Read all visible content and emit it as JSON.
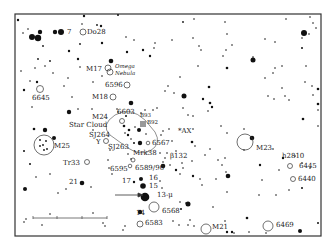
{
  "frame": {
    "x": 15,
    "y": 14,
    "w": 306,
    "h": 222
  },
  "colors": {
    "ink": "#111111",
    "background": "#ffffff",
    "frame": "#333333"
  },
  "scale_bar": {
    "x1": 33,
    "x2": 107,
    "y": 218,
    "ticks": [
      57,
      82
    ]
  },
  "arrow": {
    "x1": 115,
    "y1": 195,
    "x2": 143,
    "y2": 195,
    "label_target": "13-μ"
  },
  "labels": [
    {
      "id": "label-7",
      "text": "7",
      "x": 67,
      "y": 34
    },
    {
      "id": "label-do28",
      "text": "Do28",
      "x": 87,
      "y": 34
    },
    {
      "id": "label-m17",
      "text": "M17",
      "x": 86,
      "y": 71
    },
    {
      "id": "label-omega",
      "text": "Omega",
      "x": 115,
      "y": 68,
      "italic": true
    },
    {
      "id": "label-nebula",
      "text": "Nebula",
      "x": 115,
      "y": 75,
      "italic": true
    },
    {
      "id": "label-6596",
      "text": "6596",
      "x": 105,
      "y": 87
    },
    {
      "id": "label-6645",
      "text": "6645",
      "x": 32,
      "y": 100
    },
    {
      "id": "label-m18",
      "text": "M18",
      "x": 92,
      "y": 99
    },
    {
      "id": "label-6603",
      "text": "6603",
      "x": 117,
      "y": 114
    },
    {
      "id": "label-b93",
      "text": "B93",
      "x": 140,
      "y": 117,
      "small": true
    },
    {
      "id": "label-b92",
      "text": "B92",
      "x": 147,
      "y": 124,
      "small": true
    },
    {
      "id": "label-m24",
      "text": "M24",
      "x": 92,
      "y": 119
    },
    {
      "id": "label-star-cloud",
      "text": "Star Cloud",
      "x": 69,
      "y": 127
    },
    {
      "id": "label-sj264",
      "text": "SJ264",
      "x": 89,
      "y": 137
    },
    {
      "id": "label-y",
      "text": "Y",
      "x": 96,
      "y": 144
    },
    {
      "id": "label-sj263",
      "text": "SJ263",
      "x": 108,
      "y": 149
    },
    {
      "id": "label-ax",
      "text": "*AX",
      "x": 178,
      "y": 133
    },
    {
      "id": "label-6567",
      "text": "6567",
      "x": 152,
      "y": 145
    },
    {
      "id": "label-mrk38",
      "text": "Mrk38",
      "x": 133,
      "y": 155
    },
    {
      "id": "label-m25",
      "text": "M25",
      "x": 54,
      "y": 148
    },
    {
      "id": "label-b132",
      "text": "β132",
      "x": 170,
      "y": 158
    },
    {
      "id": "label-m23",
      "text": "M23",
      "x": 256,
      "y": 150
    },
    {
      "id": "label-tr33",
      "text": "Tr33",
      "x": 63,
      "y": 165
    },
    {
      "id": "label-6595",
      "text": "6595",
      "x": 110,
      "y": 171
    },
    {
      "id": "label-6589-90",
      "text": "6589/90",
      "x": 135,
      "y": 170
    },
    {
      "id": "label-h2810",
      "text": "h2810",
      "x": 282,
      "y": 158
    },
    {
      "id": "label-6445",
      "text": "6445",
      "x": 299,
      "y": 168
    },
    {
      "id": "label-6440",
      "text": "6440",
      "x": 298,
      "y": 181
    },
    {
      "id": "label-16",
      "text": "16",
      "x": 149,
      "y": 180
    },
    {
      "id": "label-17",
      "text": "17",
      "x": 122,
      "y": 183
    },
    {
      "id": "label-15",
      "text": "15",
      "x": 149,
      "y": 188
    },
    {
      "id": "label-13mu",
      "text": "13-μ",
      "x": 157,
      "y": 197
    },
    {
      "id": "label-21",
      "text": "21",
      "x": 69,
      "y": 184
    },
    {
      "id": "label-14",
      "text": "14",
      "x": 136,
      "y": 215
    },
    {
      "id": "label-6568",
      "text": "6568",
      "x": 162,
      "y": 213
    },
    {
      "id": "label-6583",
      "text": "6583",
      "x": 145,
      "y": 225
    },
    {
      "id": "label-m21",
      "text": "M21",
      "x": 212,
      "y": 229
    },
    {
      "id": "label-6469",
      "text": "6469",
      "x": 276,
      "y": 227
    }
  ],
  "open_objects": [
    {
      "id": "do28",
      "x": 83,
      "y": 32,
      "r": 3
    },
    {
      "id": "m17-a",
      "x": 108,
      "y": 68,
      "r": 3
    },
    {
      "id": "m17-b",
      "x": 110,
      "y": 72,
      "r": 3
    },
    {
      "id": "6596",
      "x": 127,
      "y": 85,
      "r": 3
    },
    {
      "id": "6645",
      "x": 40,
      "y": 89,
      "r": 3.5
    },
    {
      "id": "m18",
      "x": 113,
      "y": 97,
      "r": 3
    },
    {
      "id": "6603",
      "x": 122,
      "y": 121,
      "r": 2.5
    },
    {
      "id": "y-var",
      "x": 106,
      "y": 141,
      "r": 2.5
    },
    {
      "id": "m25",
      "x": 44,
      "y": 145,
      "r": 10
    },
    {
      "id": "m23",
      "x": 245,
      "y": 142,
      "r": 8
    },
    {
      "id": "tr33",
      "x": 87,
      "y": 162,
      "r": 2.5
    },
    {
      "id": "6595",
      "x": 133,
      "y": 160,
      "r": 2
    },
    {
      "id": "6589",
      "x": 130,
      "y": 166,
      "r": 1.8
    },
    {
      "id": "6445",
      "x": 290,
      "y": 166,
      "r": 2.5
    },
    {
      "id": "6440",
      "x": 293,
      "y": 179,
      "r": 2.5
    },
    {
      "id": "6568",
      "x": 154,
      "y": 207,
      "r": 5
    },
    {
      "id": "6583",
      "x": 140,
      "y": 224,
      "r": 3
    },
    {
      "id": "m21",
      "x": 206,
      "y": 229,
      "r": 5
    },
    {
      "id": "6469",
      "x": 268,
      "y": 226,
      "r": 5
    },
    {
      "id": "6567",
      "x": 148,
      "y": 143,
      "r": 1.8
    }
  ],
  "star_cloud_outline": "M 115 115 Q 130 106 145 120 L 155 132 Q 162 144 150 151 Q 140 156 128 148 L 110 135 Q 100 125 115 115 Z",
  "gray_patches": [
    {
      "id": "b92",
      "x": 140,
      "y": 121,
      "w": 6,
      "h": 6
    }
  ],
  "stars": [
    {
      "x": 18,
      "y": 20,
      "r": 1.2
    },
    {
      "x": 84,
      "y": 16,
      "r": 1.2
    },
    {
      "x": 118,
      "y": 15,
      "r": 1
    },
    {
      "x": 23,
      "y": 33,
      "r": 0.8
    },
    {
      "x": 28,
      "y": 29,
      "r": 0.8
    },
    {
      "x": 32,
      "y": 37,
      "r": 3
    },
    {
      "x": 38,
      "y": 38,
      "r": 3.2
    },
    {
      "x": 40,
      "y": 32,
      "r": 2.2
    },
    {
      "x": 55,
      "y": 32,
      "r": 2.2
    },
    {
      "x": 61,
      "y": 32,
      "r": 3
    },
    {
      "x": 43,
      "y": 46,
      "r": 0.9
    },
    {
      "x": 97,
      "y": 25,
      "r": 0.9
    },
    {
      "x": 101,
      "y": 26,
      "r": 1.2
    },
    {
      "x": 82,
      "y": 24,
      "r": 0.8
    },
    {
      "x": 69,
      "y": 51,
      "r": 1.2
    },
    {
      "x": 102,
      "y": 43,
      "r": 1.2
    },
    {
      "x": 80,
      "y": 44,
      "r": 0.9
    },
    {
      "x": 126,
      "y": 37,
      "r": 0.8
    },
    {
      "x": 134,
      "y": 40,
      "r": 0.8
    },
    {
      "x": 127,
      "y": 52,
      "r": 1.2
    },
    {
      "x": 143,
      "y": 50,
      "r": 1.2
    },
    {
      "x": 150,
      "y": 56,
      "r": 1.2
    },
    {
      "x": 154,
      "y": 48,
      "r": 0.8
    },
    {
      "x": 155,
      "y": 43,
      "r": 0.8
    },
    {
      "x": 38,
      "y": 59,
      "r": 0.9
    },
    {
      "x": 50,
      "y": 61,
      "r": 0.9
    },
    {
      "x": 35,
      "y": 68,
      "r": 0.8
    },
    {
      "x": 45,
      "y": 66,
      "r": 0.8
    },
    {
      "x": 53,
      "y": 73,
      "r": 0.8
    },
    {
      "x": 21,
      "y": 71,
      "r": 0.8
    },
    {
      "x": 78,
      "y": 59,
      "r": 1.2
    },
    {
      "x": 80,
      "y": 67,
      "r": 0.8
    },
    {
      "x": 111,
      "y": 61,
      "r": 2.3
    },
    {
      "x": 102,
      "y": 76,
      "r": 0.8
    },
    {
      "x": 30,
      "y": 81,
      "r": 0.8
    },
    {
      "x": 37,
      "y": 82,
      "r": 1.2
    },
    {
      "x": 68,
      "y": 78,
      "r": 0.8
    },
    {
      "x": 24,
      "y": 90,
      "r": 1.2
    },
    {
      "x": 64,
      "y": 86,
      "r": 0.8
    },
    {
      "x": 93,
      "y": 82,
      "r": 0.8
    },
    {
      "x": 72,
      "y": 97,
      "r": 0.8
    },
    {
      "x": 32,
      "y": 107,
      "r": 0.8
    },
    {
      "x": 131,
      "y": 103,
      "r": 2.3
    },
    {
      "x": 126,
      "y": 116,
      "r": 1
    },
    {
      "x": 117,
      "y": 109,
      "r": 0.8
    },
    {
      "x": 69,
      "y": 112,
      "r": 2.2
    },
    {
      "x": 78,
      "y": 109,
      "r": 0.8
    },
    {
      "x": 92,
      "y": 109,
      "r": 0.8
    },
    {
      "x": 183,
      "y": 22,
      "r": 0.9
    },
    {
      "x": 194,
      "y": 19,
      "r": 0.8
    },
    {
      "x": 225,
      "y": 22,
      "r": 0.8
    },
    {
      "x": 172,
      "y": 40,
      "r": 0.8
    },
    {
      "x": 193,
      "y": 38,
      "r": 0.8
    },
    {
      "x": 199,
      "y": 46,
      "r": 0.8
    },
    {
      "x": 201,
      "y": 50,
      "r": 0.8
    },
    {
      "x": 227,
      "y": 34,
      "r": 0.8
    },
    {
      "x": 226,
      "y": 50,
      "r": 0.8
    },
    {
      "x": 223,
      "y": 56,
      "r": 0.8
    },
    {
      "x": 232,
      "y": 45,
      "r": 0.8
    },
    {
      "x": 253,
      "y": 57,
      "r": 0.8
    },
    {
      "x": 253,
      "y": 60,
      "r": 2.5
    },
    {
      "x": 198,
      "y": 66,
      "r": 0.8
    },
    {
      "x": 227,
      "y": 68,
      "r": 1.3
    },
    {
      "x": 180,
      "y": 77,
      "r": 0.8
    },
    {
      "x": 165,
      "y": 91,
      "r": 0.8
    },
    {
      "x": 168,
      "y": 86,
      "r": 0.8
    },
    {
      "x": 209,
      "y": 87,
      "r": 1.3
    },
    {
      "x": 184,
      "y": 96,
      "r": 2.5
    },
    {
      "x": 203,
      "y": 99,
      "r": 1.2
    },
    {
      "x": 210,
      "y": 103,
      "r": 1.3
    },
    {
      "x": 212,
      "y": 107,
      "r": 1.2
    },
    {
      "x": 174,
      "y": 93,
      "r": 0.8
    },
    {
      "x": 193,
      "y": 116,
      "r": 0.8
    },
    {
      "x": 208,
      "y": 111,
      "r": 0.8
    },
    {
      "x": 265,
      "y": 39,
      "r": 0.8
    },
    {
      "x": 275,
      "y": 42,
      "r": 0.8
    },
    {
      "x": 286,
      "y": 19,
      "r": 0.8
    },
    {
      "x": 302,
      "y": 38,
      "r": 0.8
    },
    {
      "x": 302,
      "y": 48,
      "r": 1
    },
    {
      "x": 304,
      "y": 33,
      "r": 3
    },
    {
      "x": 309,
      "y": 34,
      "r": 0.8
    },
    {
      "x": 313,
      "y": 23,
      "r": 0.8
    },
    {
      "x": 316,
      "y": 28,
      "r": 0.8
    },
    {
      "x": 310,
      "y": 17,
      "r": 0.8
    },
    {
      "x": 275,
      "y": 68,
      "r": 0.8
    },
    {
      "x": 282,
      "y": 66,
      "r": 0.8
    },
    {
      "x": 265,
      "y": 78,
      "r": 0.8
    },
    {
      "x": 273,
      "y": 73,
      "r": 0.8
    },
    {
      "x": 282,
      "y": 88,
      "r": 0.8
    },
    {
      "x": 305,
      "y": 82,
      "r": 0.8
    },
    {
      "x": 306,
      "y": 66,
      "r": 0.8
    },
    {
      "x": 312,
      "y": 86,
      "r": 0.8
    },
    {
      "x": 318,
      "y": 89,
      "r": 1.3
    },
    {
      "x": 313,
      "y": 95,
      "r": 0.8
    },
    {
      "x": 318,
      "y": 104,
      "r": 1.3
    },
    {
      "x": 318,
      "y": 110,
      "r": 0.8
    },
    {
      "x": 268,
      "y": 96,
      "r": 0.8
    },
    {
      "x": 274,
      "y": 99,
      "r": 0.8
    },
    {
      "x": 285,
      "y": 96,
      "r": 0.8
    },
    {
      "x": 289,
      "y": 100,
      "r": 0.8
    },
    {
      "x": 303,
      "y": 119,
      "r": 1.3
    },
    {
      "x": 318,
      "y": 126,
      "r": 0.8
    },
    {
      "x": 169,
      "y": 129,
      "r": 0.8
    },
    {
      "x": 183,
      "y": 108,
      "r": 0.8
    },
    {
      "x": 188,
      "y": 115,
      "r": 0.8
    },
    {
      "x": 192,
      "y": 142,
      "r": 1.3
    },
    {
      "x": 205,
      "y": 155,
      "r": 0.8
    },
    {
      "x": 210,
      "y": 149,
      "r": 0.8
    },
    {
      "x": 221,
      "y": 126,
      "r": 0.8
    },
    {
      "x": 227,
      "y": 133,
      "r": 0.8
    },
    {
      "x": 244,
      "y": 129,
      "r": 0.8
    },
    {
      "x": 252,
      "y": 138,
      "r": 2.3
    },
    {
      "x": 273,
      "y": 149,
      "r": 0.8
    },
    {
      "x": 283,
      "y": 158,
      "r": 1.2
    },
    {
      "x": 244,
      "y": 150,
      "r": 0.8
    },
    {
      "x": 225,
      "y": 158,
      "r": 0.8
    },
    {
      "x": 260,
      "y": 165,
      "r": 1.2
    },
    {
      "x": 279,
      "y": 170,
      "r": 0.8
    },
    {
      "x": 295,
      "y": 156,
      "r": 0.8
    },
    {
      "x": 302,
      "y": 163,
      "r": 0.8
    },
    {
      "x": 310,
      "y": 168,
      "r": 0.8
    },
    {
      "x": 289,
      "y": 190,
      "r": 0.8
    },
    {
      "x": 302,
      "y": 188,
      "r": 1
    },
    {
      "x": 226,
      "y": 172,
      "r": 0.8
    },
    {
      "x": 216,
      "y": 179,
      "r": 0.8
    },
    {
      "x": 227,
      "y": 192,
      "r": 0.8
    },
    {
      "x": 262,
      "y": 180,
      "r": 0.8
    },
    {
      "x": 193,
      "y": 176,
      "r": 1.2
    },
    {
      "x": 202,
      "y": 185,
      "r": 0.8
    },
    {
      "x": 200,
      "y": 179,
      "r": 0.8
    },
    {
      "x": 218,
      "y": 160,
      "r": 0.8
    },
    {
      "x": 222,
      "y": 165,
      "r": 0.8
    },
    {
      "x": 228,
      "y": 176,
      "r": 2.3
    },
    {
      "x": 259,
      "y": 195,
      "r": 0.8
    },
    {
      "x": 276,
      "y": 195,
      "r": 0.8
    },
    {
      "x": 213,
      "y": 207,
      "r": 0.8
    },
    {
      "x": 247,
      "y": 218,
      "r": 1.3
    },
    {
      "x": 225,
      "y": 221,
      "r": 0.8
    },
    {
      "x": 227,
      "y": 232,
      "r": 1.2
    },
    {
      "x": 232,
      "y": 232,
      "r": 1.2
    },
    {
      "x": 234,
      "y": 233,
      "r": 0.8
    },
    {
      "x": 249,
      "y": 232,
      "r": 0.8
    },
    {
      "x": 266,
      "y": 233,
      "r": 0.8
    },
    {
      "x": 300,
      "y": 231,
      "r": 2
    },
    {
      "x": 318,
      "y": 223,
      "r": 1
    },
    {
      "x": 180,
      "y": 174,
      "r": 0.8
    },
    {
      "x": 180,
      "y": 202,
      "r": 0.8
    },
    {
      "x": 186,
      "y": 203,
      "r": 0.8
    },
    {
      "x": 188,
      "y": 204,
      "r": 2.5
    },
    {
      "x": 181,
      "y": 209,
      "r": 1
    },
    {
      "x": 190,
      "y": 220,
      "r": 0.8
    },
    {
      "x": 173,
      "y": 221,
      "r": 0.8
    },
    {
      "x": 179,
      "y": 225,
      "r": 0.8
    },
    {
      "x": 194,
      "y": 226,
      "r": 0.8
    },
    {
      "x": 188,
      "y": 225,
      "r": 0.8
    },
    {
      "x": 34,
      "y": 129,
      "r": 1.3
    },
    {
      "x": 45,
      "y": 130,
      "r": 2.2
    },
    {
      "x": 24,
      "y": 151,
      "r": 1
    },
    {
      "x": 54,
      "y": 138,
      "r": 2
    },
    {
      "x": 40,
      "y": 140,
      "r": 0.9
    },
    {
      "x": 46,
      "y": 141,
      "r": 0.9
    },
    {
      "x": 43,
      "y": 145,
      "r": 0.9
    },
    {
      "x": 40,
      "y": 146,
      "r": 0.9
    },
    {
      "x": 47,
      "y": 149,
      "r": 0.9
    },
    {
      "x": 44,
      "y": 150,
      "r": 0.9
    },
    {
      "x": 30,
      "y": 164,
      "r": 1
    },
    {
      "x": 36,
      "y": 177,
      "r": 0.8
    },
    {
      "x": 50,
      "y": 174,
      "r": 0.8
    },
    {
      "x": 25,
      "y": 189,
      "r": 2
    },
    {
      "x": 58,
      "y": 193,
      "r": 0.8
    },
    {
      "x": 66,
      "y": 189,
      "r": 0.8
    },
    {
      "x": 82,
      "y": 183,
      "r": 2.3
    },
    {
      "x": 91,
      "y": 187,
      "r": 0.8
    },
    {
      "x": 50,
      "y": 214,
      "r": 0.8
    },
    {
      "x": 93,
      "y": 213,
      "r": 0.8
    },
    {
      "x": 26,
      "y": 219,
      "r": 0.8
    },
    {
      "x": 24,
      "y": 222,
      "r": 0.8
    },
    {
      "x": 42,
      "y": 225,
      "r": 0.8
    },
    {
      "x": 103,
      "y": 223,
      "r": 0.8
    },
    {
      "x": 105,
      "y": 226,
      "r": 0.8
    },
    {
      "x": 125,
      "y": 226,
      "r": 0.8
    },
    {
      "x": 123,
      "y": 230,
      "r": 0.8
    },
    {
      "x": 93,
      "y": 130,
      "r": 0.8
    },
    {
      "x": 110,
      "y": 150,
      "r": 0.8
    },
    {
      "x": 108,
      "y": 160,
      "r": 0.8
    },
    {
      "x": 109,
      "y": 168,
      "r": 0.8
    },
    {
      "x": 112,
      "y": 174,
      "r": 0.8
    },
    {
      "x": 128,
      "y": 154,
      "r": 0.8
    },
    {
      "x": 131,
      "y": 159,
      "r": 0.8
    },
    {
      "x": 118,
      "y": 112,
      "r": 0.8
    },
    {
      "x": 124,
      "y": 126,
      "r": 1.3
    },
    {
      "x": 129,
      "y": 130,
      "r": 1.3
    },
    {
      "x": 135,
      "y": 127,
      "r": 0.8
    },
    {
      "x": 125,
      "y": 133,
      "r": 0.8
    },
    {
      "x": 128,
      "y": 135,
      "r": 1.2
    },
    {
      "x": 131,
      "y": 139,
      "r": 0.8
    },
    {
      "x": 139,
      "y": 130,
      "r": 2
    },
    {
      "x": 134,
      "y": 143,
      "r": 1
    },
    {
      "x": 140,
      "y": 143,
      "r": 2.2
    },
    {
      "x": 146,
      "y": 134,
      "r": 0.8
    },
    {
      "x": 145,
      "y": 110,
      "r": 0.8
    },
    {
      "x": 141,
      "y": 113,
      "r": 0.8
    },
    {
      "x": 153,
      "y": 110,
      "r": 0.8
    },
    {
      "x": 157,
      "y": 108,
      "r": 0.8
    },
    {
      "x": 163,
      "y": 131,
      "r": 0.8
    },
    {
      "x": 161,
      "y": 135,
      "r": 0.8
    },
    {
      "x": 172,
      "y": 141,
      "r": 0.8
    },
    {
      "x": 160,
      "y": 153,
      "r": 0.8
    },
    {
      "x": 165,
      "y": 158,
      "r": 0.8
    },
    {
      "x": 167,
      "y": 153,
      "r": 0.8
    },
    {
      "x": 163,
      "y": 162,
      "r": 0.8
    },
    {
      "x": 170,
      "y": 165,
      "r": 0.8
    },
    {
      "x": 163,
      "y": 166,
      "r": 2.3
    },
    {
      "x": 176,
      "y": 151,
      "r": 0.8
    },
    {
      "x": 182,
      "y": 163,
      "r": 0.8
    },
    {
      "x": 183,
      "y": 168,
      "r": 0.8
    },
    {
      "x": 192,
      "y": 161,
      "r": 0.8
    },
    {
      "x": 193,
      "y": 129,
      "r": 0.8
    },
    {
      "x": 195,
      "y": 146,
      "r": 0.8
    },
    {
      "x": 176,
      "y": 170,
      "r": 1.2
    },
    {
      "x": 141,
      "y": 179,
      "r": 2
    },
    {
      "x": 134,
      "y": 182,
      "r": 1.2
    },
    {
      "x": 143,
      "y": 186,
      "r": 2.8
    },
    {
      "x": 145,
      "y": 197,
      "r": 4.3
    },
    {
      "x": 140,
      "y": 212,
      "r": 2.2
    },
    {
      "x": 160,
      "y": 181,
      "r": 0.8
    },
    {
      "x": 162,
      "y": 188,
      "r": 0.8
    }
  ]
}
